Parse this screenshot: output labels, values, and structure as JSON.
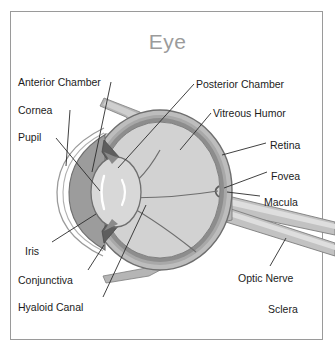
{
  "title": "Eye",
  "frame": {
    "border_color": "#9a9a9a",
    "background": "#ffffff"
  },
  "colors": {
    "title_text": "#9b9b9b",
    "label_text": "#1c1c1c",
    "leader_line": "#2b2b2b",
    "vitreous": "#d2d2d2",
    "sclera": "#bdbdbd",
    "retina_rim": "#8d8d8d",
    "choroid": "#a8a8a8",
    "lens": "#d8d8d8",
    "iris": "#9c9c9c",
    "cornea": "#ffffff",
    "optic_nerve": "#c2c2c2",
    "muscle": "#b5b5b5",
    "outline": "#6f6f6f"
  },
  "diagram": {
    "type": "anatomical-cross-section",
    "orientation": "anterior at left, posterior at right",
    "label_count": 12
  },
  "labels": [
    {
      "id": "anterior-chamber",
      "text": "Anterior Chamber",
      "side": "left",
      "x": 18,
      "y": 76,
      "leader": true
    },
    {
      "id": "cornea",
      "text": "Cornea",
      "side": "left",
      "x": 18,
      "y": 104,
      "leader": true
    },
    {
      "id": "pupil",
      "text": "Pupil",
      "side": "left",
      "x": 18,
      "y": 131,
      "leader": true
    },
    {
      "id": "iris",
      "text": "Iris",
      "side": "left",
      "x": 25,
      "y": 245,
      "leader": true
    },
    {
      "id": "conjunctiva",
      "text": "Conjunctiva",
      "side": "left",
      "x": 18,
      "y": 274,
      "leader": true
    },
    {
      "id": "hyaloid-canal",
      "text": "Hyaloid Canal",
      "side": "left",
      "x": 18,
      "y": 301,
      "leader": true
    },
    {
      "id": "posterior-chamber",
      "text": "Posterior Chamber",
      "side": "right",
      "x": 196,
      "y": 78,
      "leader": true
    },
    {
      "id": "vitreous-humor",
      "text": "Vitreous Humor",
      "side": "right",
      "x": 213,
      "y": 107,
      "leader": true
    },
    {
      "id": "retina",
      "text": "Retina",
      "side": "right",
      "x": 270,
      "y": 139,
      "leader": true
    },
    {
      "id": "fovea",
      "text": "Fovea",
      "side": "right",
      "x": 271,
      "y": 170,
      "leader": true
    },
    {
      "id": "macula",
      "text": "Macula",
      "side": "right",
      "x": 264,
      "y": 196,
      "leader": true
    },
    {
      "id": "optic-nerve",
      "text": "Optic Nerve",
      "side": "right",
      "x": 238,
      "y": 272,
      "leader": true
    },
    {
      "id": "sclera",
      "text": "Sclera",
      "side": "right",
      "x": 268,
      "y": 303,
      "leader": false
    }
  ]
}
